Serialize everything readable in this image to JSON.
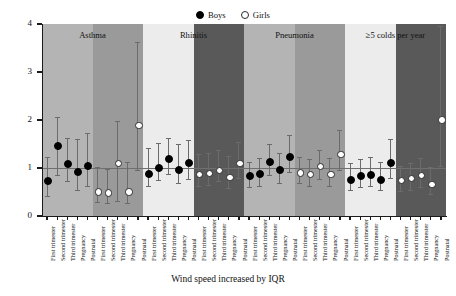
{
  "chart_data": {
    "type": "scatter",
    "title": "",
    "xlabel": "Wind speed increased by IQR",
    "ylabel": "OR (95% CI)",
    "ylim": [
      0,
      4
    ],
    "yticks": [
      0,
      1,
      2,
      3,
      4
    ],
    "ytick_labels": [
      "0",
      "1",
      "2",
      "3",
      "4"
    ],
    "grid": false,
    "reference_line": 1,
    "legend_position": "top-center",
    "legend": [
      {
        "label": "Boys",
        "marker": "filled-circle",
        "color": "#000000"
      },
      {
        "label": "Girls",
        "marker": "open-circle",
        "color": "#ffffff"
      }
    ],
    "categories": [
      "First trimester",
      "Second trimester",
      "Third trimester",
      "Pregnancy",
      "Postnatal"
    ],
    "panels": [
      {
        "title": "Asthma",
        "groups": [
          {
            "sex": "Boys",
            "band_color": "#b4b4b4",
            "points": [
              {
                "category": "First trimester",
                "or": 0.75,
                "low": 0.42,
                "high": 1.22
              },
              {
                "category": "Second trimester",
                "or": 1.48,
                "low": 0.85,
                "high": 2.07
              },
              {
                "category": "Third trimester",
                "or": 1.1,
                "low": 0.72,
                "high": 1.62
              },
              {
                "category": "Pregnancy",
                "or": 0.93,
                "low": 0.55,
                "high": 1.6
              },
              {
                "category": "Postnatal",
                "or": 1.07,
                "low": 0.62,
                "high": 1.72
              }
            ]
          },
          {
            "sex": "Girls",
            "band_color": "#9a9a9a",
            "points": [
              {
                "category": "First trimester",
                "or": 0.52,
                "low": 0.3,
                "high": 1.02
              },
              {
                "category": "Second trimester",
                "or": 0.5,
                "low": 0.28,
                "high": 0.98
              },
              {
                "category": "Third trimester",
                "or": 1.12,
                "low": 0.32,
                "high": 1.98
              },
              {
                "category": "Pregnancy",
                "or": 0.52,
                "low": 0.28,
                "high": 1.12
              },
              {
                "category": "Postnatal",
                "or": 1.9,
                "low": 0.95,
                "high": 3.62
              }
            ]
          }
        ]
      },
      {
        "title": "Rhinitis",
        "groups": [
          {
            "sex": "Boys",
            "band_color": "#ececec",
            "points": [
              {
                "category": "First trimester",
                "or": 0.9,
                "low": 0.62,
                "high": 1.42
              },
              {
                "category": "Second trimester",
                "or": 1.03,
                "low": 0.75,
                "high": 1.53
              },
              {
                "category": "Third trimester",
                "or": 1.2,
                "low": 0.88,
                "high": 1.62
              },
              {
                "category": "Pregnancy",
                "or": 0.98,
                "low": 0.68,
                "high": 1.5
              },
              {
                "category": "Postnatal",
                "or": 1.12,
                "low": 0.78,
                "high": 1.58
              }
            ]
          },
          {
            "sex": "Girls",
            "band_color": "#595959",
            "points": [
              {
                "category": "First trimester",
                "or": 0.88,
                "low": 0.62,
                "high": 1.3
              },
              {
                "category": "Second trimester",
                "or": 0.9,
                "low": 0.65,
                "high": 1.32
              },
              {
                "category": "Third trimester",
                "or": 0.97,
                "low": 0.72,
                "high": 1.38
              },
              {
                "category": "Pregnancy",
                "or": 0.82,
                "low": 0.58,
                "high": 1.25
              },
              {
                "category": "Postnatal",
                "or": 1.12,
                "low": 0.8,
                "high": 1.55
              }
            ]
          }
        ]
      },
      {
        "title": "Pneumonia",
        "groups": [
          {
            "sex": "Boys",
            "band_color": "#b4b4b4",
            "points": [
              {
                "category": "First trimester",
                "or": 0.85,
                "low": 0.6,
                "high": 1.12
              },
              {
                "category": "Second trimester",
                "or": 0.9,
                "low": 0.62,
                "high": 1.2
              },
              {
                "category": "Third trimester",
                "or": 1.15,
                "low": 0.85,
                "high": 1.5
              },
              {
                "category": "Pregnancy",
                "or": 0.98,
                "low": 0.68,
                "high": 1.32
              },
              {
                "category": "Postnatal",
                "or": 1.25,
                "low": 0.92,
                "high": 1.68
              }
            ]
          },
          {
            "sex": "Girls",
            "band_color": "#9a9a9a",
            "points": [
              {
                "category": "First trimester",
                "or": 0.92,
                "low": 0.68,
                "high": 1.22
              },
              {
                "category": "Second trimester",
                "or": 0.88,
                "low": 0.62,
                "high": 1.18
              },
              {
                "category": "Third trimester",
                "or": 1.05,
                "low": 0.78,
                "high": 1.38
              },
              {
                "category": "Pregnancy",
                "or": 0.88,
                "low": 0.62,
                "high": 1.2
              },
              {
                "category": "Postnatal",
                "or": 1.3,
                "low": 0.95,
                "high": 1.8
              }
            ]
          }
        ]
      },
      {
        "title": "≥5 colds per year",
        "groups": [
          {
            "sex": "Boys",
            "band_color": "#ececec",
            "points": [
              {
                "category": "First trimester",
                "or": 0.78,
                "low": 0.55,
                "high": 1.1
              },
              {
                "category": "Second trimester",
                "or": 0.85,
                "low": 0.6,
                "high": 1.18
              },
              {
                "category": "Third trimester",
                "or": 0.87,
                "low": 0.62,
                "high": 1.22
              },
              {
                "category": "Pregnancy",
                "or": 0.78,
                "low": 0.55,
                "high": 1.12
              },
              {
                "category": "Postnatal",
                "or": 1.13,
                "low": 0.8,
                "high": 1.6
              }
            ]
          },
          {
            "sex": "Girls",
            "band_color": "#595959",
            "points": [
              {
                "category": "First trimester",
                "or": 0.76,
                "low": 0.52,
                "high": 1.05
              },
              {
                "category": "Second trimester",
                "or": 0.8,
                "low": 0.55,
                "high": 1.1
              },
              {
                "category": "Third trimester",
                "or": 0.87,
                "low": 0.6,
                "high": 1.2
              },
              {
                "category": "Pregnancy",
                "or": 0.68,
                "low": 0.45,
                "high": 1.02
              },
              {
                "category": "Postnatal",
                "or": 2.02,
                "low": 1.05,
                "high": 3.95
              }
            ]
          }
        ]
      }
    ]
  }
}
